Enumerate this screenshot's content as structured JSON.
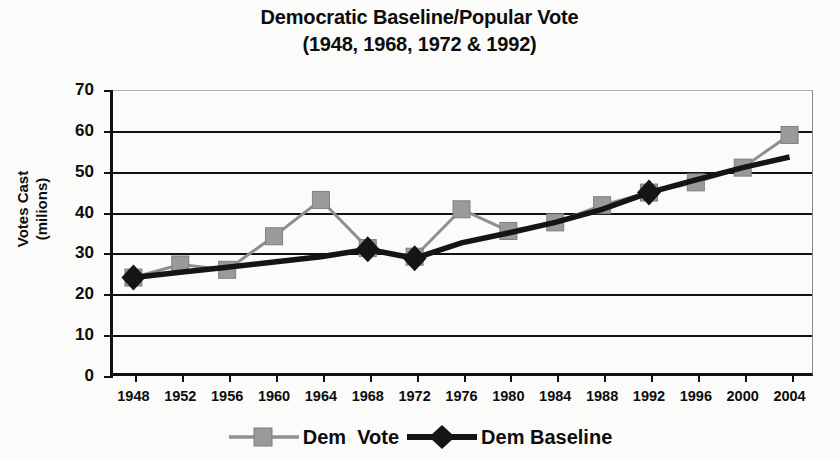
{
  "chart_data": {
    "type": "line",
    "title": "Democratic Baseline/Popular Vote",
    "subtitle": "(1948, 1968, 1972 & 1992)",
    "title_lines": [
      "Democratic Baseline/Popular Vote",
      "(1948, 1968, 1972 & 1992)"
    ],
    "xlabel": "",
    "ylabel_lines": [
      "Votes Cast",
      "(milions)"
    ],
    "ylabel": "Votes Cast (milions)",
    "ylim": [
      0,
      70
    ],
    "ytick_step": 10,
    "yticks": [
      "70",
      "60",
      "50",
      "40",
      "30",
      "20",
      "10",
      "0"
    ],
    "ytick_values": [
      70,
      60,
      50,
      40,
      30,
      20,
      10,
      0
    ],
    "grid": true,
    "legend_position": "bottom",
    "categories": [
      "1948",
      "1952",
      "1956",
      "1960",
      "1964",
      "1968",
      "1972",
      "1976",
      "1980",
      "1984",
      "1988",
      "1992",
      "1996",
      "2000",
      "2004"
    ],
    "x": [
      1948,
      1952,
      1956,
      1960,
      1964,
      1968,
      1972,
      1976,
      1980,
      1984,
      1988,
      1992,
      1996,
      2000,
      2004
    ],
    "series": [
      {
        "name": "Dem  Vote",
        "color": "#8f8f8f",
        "marker": "square",
        "values": [
          24.1,
          27.3,
          26.0,
          34.2,
          43.1,
          31.3,
          29.2,
          40.8,
          35.5,
          37.6,
          41.8,
          44.9,
          47.4,
          51.0,
          59.0
        ]
      },
      {
        "name": "Dem Baseline",
        "color": "#151515",
        "marker": "diamond",
        "values": [
          24.1,
          25.4,
          26.6,
          27.9,
          29.2,
          31.0,
          28.8,
          32.6,
          35.0,
          37.6,
          40.8,
          44.9,
          48.0,
          51.0,
          53.6
        ]
      }
    ],
    "highlight_points": [
      {
        "year": "1948",
        "series": "Dem Baseline",
        "value": 24.1
      },
      {
        "year": "1968",
        "series": "Dem Baseline",
        "value": 31.0
      },
      {
        "year": "1972",
        "series": "Dem Baseline",
        "value": 28.8
      },
      {
        "year": "1992",
        "series": "Dem Baseline",
        "value": 44.9
      }
    ]
  },
  "legend": {
    "items": [
      {
        "label": "Dem  Vote",
        "color": "#8f8f8f",
        "marker": "square"
      },
      {
        "label": "Dem Baseline",
        "color": "#151515",
        "marker": "diamond"
      }
    ]
  }
}
